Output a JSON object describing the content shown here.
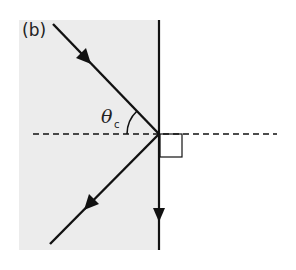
{
  "figure": {
    "panel_label": "(b)",
    "angle_label": {
      "symbol": "θ",
      "subscript": "c"
    },
    "colors": {
      "medium_fill": "#ececec",
      "stroke": "#111111",
      "background": "#ffffff"
    },
    "elements": {
      "medium_region": "shaded optical medium (gray)",
      "interface": "vertical boundary line with downward arrow",
      "incident_ray": "ray travelling down-right toward interface",
      "reflected_ray": "ray travelling down-left away from interface",
      "normal": "dashed horizontal normal through point of incidence",
      "right_angle_marker": "small square between normal and interface"
    }
  }
}
